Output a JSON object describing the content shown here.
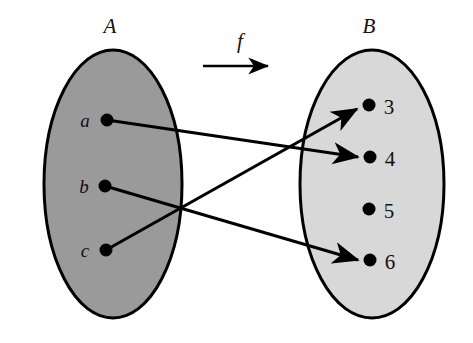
{
  "figure": {
    "type": "set-mapping-diagram",
    "function_label": "f",
    "sets": [
      {
        "id": "A",
        "label": "A",
        "label_x": 110,
        "label_y": 33,
        "fill": "#9a9a9a",
        "stroke": "#000000",
        "cx": 113,
        "cy": 184,
        "rx": 69,
        "ry": 134,
        "elements": [
          {
            "label": "a",
            "dot_x": 107,
            "dot_y": 120,
            "label_x": 85,
            "label_y": 127
          },
          {
            "label": "b",
            "dot_x": 105,
            "dot_y": 186,
            "label_x": 84,
            "label_y": 193
          },
          {
            "label": "c",
            "dot_x": 106,
            "dot_y": 250,
            "label_x": 85,
            "label_y": 257
          }
        ]
      },
      {
        "id": "B",
        "label": "B",
        "label_x": 369,
        "label_y": 33,
        "fill": "#d8d8d8",
        "stroke": "#000000",
        "cx": 372,
        "cy": 184,
        "rx": 72,
        "ry": 134,
        "elements": [
          {
            "label": "3",
            "dot_x": 369,
            "dot_y": 105,
            "label_x": 386,
            "label_y": 114
          },
          {
            "label": "4",
            "dot_x": 370,
            "dot_y": 157,
            "label_x": 387,
            "label_y": 166
          },
          {
            "label": "5",
            "dot_x": 369,
            "dot_y": 209,
            "label_x": 386,
            "label_y": 218
          },
          {
            "label": "6",
            "dot_x": 370,
            "dot_y": 260,
            "label_x": 387,
            "label_y": 269
          }
        ]
      }
    ],
    "function_arrow": {
      "label": "f",
      "label_x": 240,
      "label_y": 48,
      "x1": 203,
      "y1": 66,
      "x2": 272,
      "y2": 66
    },
    "mappings": [
      {
        "from": "a",
        "to": "4",
        "x1": 107,
        "y1": 120,
        "x2": 364,
        "y2": 157
      },
      {
        "from": "b",
        "to": "6",
        "x1": 105,
        "y1": 186,
        "x2": 364,
        "y2": 260
      },
      {
        "from": "c",
        "to": "3",
        "x1": 106,
        "y1": 250,
        "x2": 363,
        "y2": 108
      }
    ],
    "unmapped_elements": [
      "5"
    ],
    "colors": {
      "set_a_fill": "#9a9a9a",
      "set_b_fill": "#d8d8d8",
      "stroke": "#000000",
      "background": "#ffffff"
    }
  }
}
